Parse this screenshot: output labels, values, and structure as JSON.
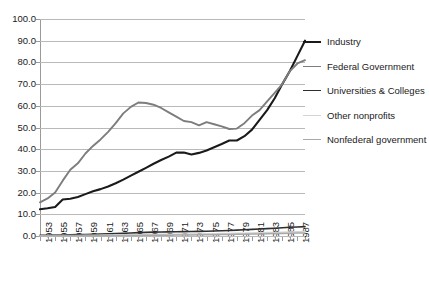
{
  "chart_data": {
    "type": "line",
    "title": "",
    "subtitle": "",
    "xlabel": "",
    "ylabel": "",
    "grid": true,
    "legend_position": "right",
    "xlim": [
      1953,
      1988
    ],
    "ylim": [
      0.0,
      100.0
    ],
    "ytick_step": 10.0,
    "ytick_labels": [
      "0.0",
      "10.0",
      "20.0",
      "30.0",
      "40.0",
      "50.0",
      "60.0",
      "70.0",
      "80.0",
      "90.0",
      "100.0"
    ],
    "ytick_values": [
      0.0,
      10.0,
      20.0,
      30.0,
      40.0,
      50.0,
      60.0,
      70.0,
      80.0,
      90.0,
      100.0
    ],
    "x": [
      1953,
      1954,
      1955,
      1956,
      1957,
      1958,
      1959,
      1960,
      1961,
      1962,
      1963,
      1964,
      1965,
      1966,
      1967,
      1968,
      1969,
      1970,
      1971,
      1972,
      1973,
      1974,
      1975,
      1976,
      1977,
      1978,
      1979,
      1980,
      1981,
      1982,
      1983,
      1984,
      1985,
      1986,
      1987,
      1988
    ],
    "xtick_labels": [
      "1953",
      "1955",
      "1957",
      "1959",
      "1961",
      "1963",
      "1965",
      "1967",
      "1969",
      "1971",
      "1973",
      "1975",
      "1977",
      "1979",
      "1981",
      "1983",
      "1985",
      "1987"
    ],
    "xtick_label_interval_years": 2,
    "minor_tick_interval_years": 1,
    "series": [
      {
        "name": "Industry",
        "color": "#1a1a1a",
        "width": 2.1,
        "values": [
          12.3,
          12.8,
          13.4,
          16.8,
          17.2,
          18.0,
          19.3,
          20.6,
          21.6,
          22.8,
          24.3,
          26.0,
          27.8,
          29.6,
          31.4,
          33.3,
          35.0,
          36.6,
          38.4,
          38.5,
          37.6,
          38.3,
          39.4,
          40.9,
          42.4,
          44.0,
          44.0,
          46.0,
          49.0,
          53.5,
          58.0,
          63.5,
          70.0,
          76.0,
          83.0,
          90.0
        ]
      },
      {
        "name": "Federal Government",
        "color": "#7d7d7d",
        "width": 1.9,
        "values": [
          15.5,
          17.3,
          20.0,
          25.5,
          30.5,
          33.5,
          38.0,
          41.5,
          44.5,
          48.0,
          52.0,
          56.5,
          59.5,
          61.5,
          61.3,
          60.5,
          59.0,
          57.0,
          55.0,
          53.0,
          52.5,
          51.0,
          52.5,
          51.5,
          50.5,
          49.3,
          49.5,
          52.0,
          55.5,
          58.0,
          62.0,
          66.0,
          70.0,
          76.0,
          79.5,
          81.0
        ]
      },
      {
        "name": "Universities & Colleges",
        "color": "#2e2e2e",
        "width": 1.6,
        "values": [
          0.35,
          0.38,
          0.42,
          0.48,
          0.55,
          0.62,
          0.7,
          0.8,
          0.9,
          1.0,
          1.12,
          1.25,
          1.4,
          1.55,
          1.68,
          1.78,
          1.85,
          1.9,
          1.95,
          2.0,
          2.05,
          2.12,
          2.2,
          2.3,
          2.42,
          2.55,
          2.7,
          2.88,
          3.05,
          3.2,
          3.4,
          3.6,
          3.8,
          4.0,
          4.15,
          4.3
        ]
      },
      {
        "name": "Other nonprofits",
        "color": "#d4d4d4",
        "width": 1.5,
        "values": [
          0.15,
          0.17,
          0.19,
          0.22,
          0.25,
          0.28,
          0.32,
          0.36,
          0.4,
          0.44,
          0.48,
          0.53,
          0.58,
          0.63,
          0.68,
          0.72,
          0.76,
          0.8,
          0.84,
          0.88,
          0.92,
          0.96,
          1.0,
          1.06,
          1.12,
          1.18,
          1.25,
          1.32,
          1.4,
          1.48,
          1.56,
          1.65,
          1.75,
          1.85,
          1.95,
          2.05
        ]
      },
      {
        "name": "Nonfederal government",
        "color": "#a8a8a8",
        "width": 1.5,
        "values": [
          0.05,
          0.06,
          0.07,
          0.08,
          0.09,
          0.1,
          0.12,
          0.14,
          0.16,
          0.18,
          0.2,
          0.22,
          0.25,
          0.28,
          0.31,
          0.34,
          0.37,
          0.4,
          0.43,
          0.46,
          0.5,
          0.54,
          0.58,
          0.62,
          0.67,
          0.72,
          0.78,
          0.84,
          0.9,
          0.96,
          1.03,
          1.1,
          1.18,
          1.26,
          1.34,
          1.42
        ]
      }
    ]
  },
  "legend": {
    "items": [
      {
        "label": "Industry"
      },
      {
        "label": "Federal Government"
      },
      {
        "label": "Universities & Colleges"
      },
      {
        "label": "Other nonprofits"
      },
      {
        "label": "Nonfederal government"
      }
    ]
  }
}
